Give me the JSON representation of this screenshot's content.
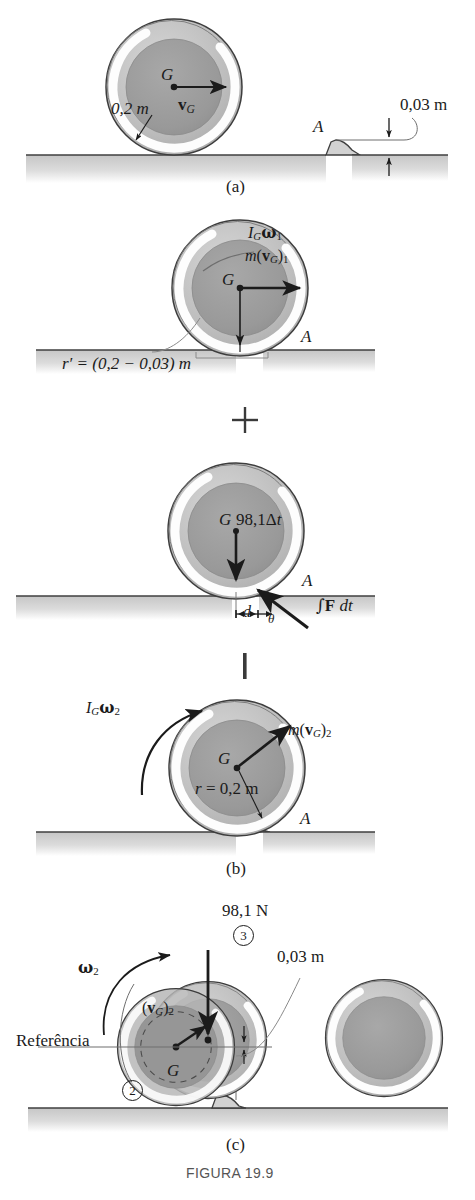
{
  "figure": {
    "caption": "FIGURA 19.9",
    "panel_labels": {
      "a": "(a)",
      "b": "(b)",
      "c": "(c)"
    },
    "operators": {
      "plus": "+",
      "equals": "|"
    }
  },
  "panel_a": {
    "center_label": "G",
    "radius_label": "0,2 m",
    "velocity_label_main": "v",
    "velocity_label_sub": "G",
    "step_label": "A",
    "step_height": "0,03 m"
  },
  "panel_momentum_1": {
    "angular_momentum_main": "I",
    "angular_momentum_sub": "G",
    "angular_momentum_omega": "ω",
    "angular_momentum_omega_sub": "1",
    "linear_momentum_m": "m",
    "linear_momentum_v": "v",
    "linear_momentum_vsub": "G",
    "linear_momentum_outsub": "1",
    "center_label": "G",
    "step_label": "A",
    "moment_arm": "r′ = (0,2 − 0,03) m"
  },
  "panel_impulse": {
    "center_label": "G",
    "weight_impulse": "98,1Δ",
    "weight_impulse_t": "t",
    "step_label": "A",
    "distance_label": "d",
    "angle_label": "θ",
    "force_impulse": "F",
    "force_impulse_int": "∫",
    "force_impulse_dt": "dt"
  },
  "panel_momentum_2": {
    "angular_momentum_main": "I",
    "angular_momentum_sub": "G",
    "angular_momentum_omega": "ω",
    "angular_momentum_omega_sub": "2",
    "linear_momentum_m": "m",
    "linear_momentum_v": "v",
    "linear_momentum_vsub": "G",
    "linear_momentum_outsub": "2",
    "center_label": "G",
    "radius_label_r": "r",
    "radius_label_val": "= 0,2 m",
    "step_label": "A"
  },
  "panel_c": {
    "weight_label": "98,1 N",
    "state_3": "3",
    "state_2": "2",
    "step_height": "0,03 m",
    "omega_label": "ω",
    "omega_sub": "2",
    "velocity_v": "v",
    "velocity_vsub": "G",
    "velocity_outsub": "2",
    "datum_label": "Referência",
    "center_label": "G"
  },
  "colors": {
    "ink": "#1b1b1b",
    "outer_ring": "#b9b9b9",
    "inner_disk": "#9a9a9a",
    "highlight": "#fbfbfb",
    "ground": "#cfcfcf",
    "ground_line": "#4a4a4a",
    "thin_line": "#6e6e6e",
    "caption_gray": "#555555"
  }
}
